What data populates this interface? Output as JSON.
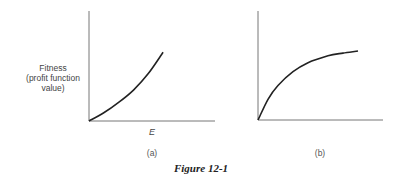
{
  "chart_data": [
    {
      "type": "line",
      "panel_label": "(a)",
      "ylabel": [
        "Fitness",
        "(profit function",
        "value)"
      ],
      "xlabel": "E",
      "description": "convex increasing curve (accelerating)",
      "x": [
        0,
        0.2,
        0.4,
        0.6,
        0.8,
        1.0
      ],
      "values": [
        0,
        0.12,
        0.27,
        0.45,
        0.69,
        1.0
      ],
      "xlim": [
        0,
        1.7
      ],
      "ylim": [
        0,
        1.6
      ],
      "grid": false
    },
    {
      "type": "line",
      "panel_label": "(b)",
      "ylabel": [],
      "xlabel": "",
      "description": "concave increasing curve (diminishing returns)",
      "x": [
        0,
        0.1,
        0.2,
        0.35,
        0.5,
        0.7,
        0.85,
        1.0
      ],
      "values": [
        0,
        0.3,
        0.5,
        0.7,
        0.83,
        0.93,
        0.97,
        1.0
      ],
      "xlim": [
        0,
        1.25
      ],
      "ylim": [
        0,
        1.58
      ],
      "grid": false
    }
  ],
  "caption": "Figure 12-1"
}
